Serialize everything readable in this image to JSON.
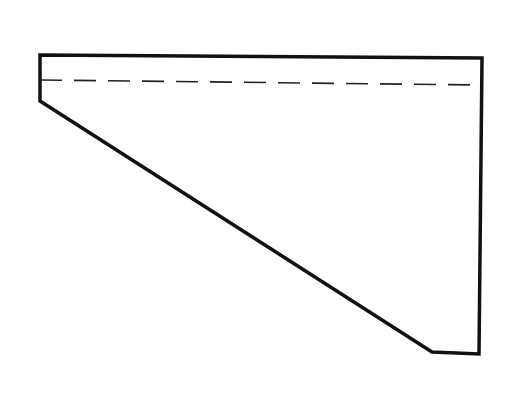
{
  "diagram": {
    "background": "#ffffff",
    "stroke_color": "#111111",
    "outline_points": [
      [
        40,
        55
      ],
      [
        482,
        58
      ],
      [
        479,
        354
      ],
      [
        432,
        352
      ],
      [
        40,
        101
      ]
    ],
    "dashed_line": {
      "x1": 40,
      "y1": 80,
      "x2": 482,
      "y2": 85,
      "dasharray": "22,12"
    },
    "labels": []
  }
}
